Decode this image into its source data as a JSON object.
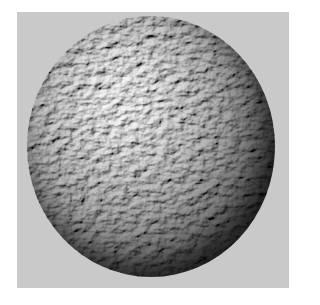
{
  "image": {
    "description": "Grayscale rendered sphere with rough, rocky bump-mapped surface texture on a light gray square backdrop",
    "subject": "textured sphere",
    "colors": {
      "page_background": "#ffffff",
      "backdrop": "#c9c9c9",
      "sphere_highlight": "#8a8a8a",
      "sphere_shadow": "#141414"
    }
  }
}
